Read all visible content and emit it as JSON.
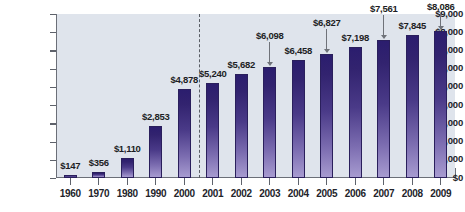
{
  "chart_data": {
    "type": "bar",
    "title": "",
    "subtitle": "",
    "xlabel": "",
    "ylabel": "",
    "ylim": [
      0,
      9000
    ],
    "ytick_step": 1000,
    "grid": false,
    "legend": null,
    "value_prefix": "$",
    "categories": [
      "1960",
      "1970",
      "1980",
      "1990",
      "2000",
      "2001",
      "2002",
      "2003",
      "2004",
      "2005",
      "2006",
      "2007",
      "2008",
      "2009"
    ],
    "values": [
      147,
      356,
      1110,
      2853,
      4878,
      5240,
      5682,
      6098,
      6458,
      6827,
      7198,
      7561,
      7845,
      8086
    ],
    "value_labels": [
      "$147",
      "$356",
      "$1,110",
      "$2,853",
      "$4,878",
      "$5,240",
      "$5,682",
      "$6,098",
      "$6,458",
      "$6,827",
      "$7,198",
      "$7,561",
      "$7,845",
      "$8,086"
    ],
    "ytick_labels": [
      "$9,000",
      "$8,000",
      "$7,000",
      "$6,000",
      "$5,000",
      "$4,000",
      "$3,000",
      "$2,000",
      "$1,000",
      "$0"
    ],
    "ytick_values": [
      9000,
      8000,
      7000,
      6000,
      5000,
      4000,
      3000,
      2000,
      1000,
      0
    ],
    "annotations": [
      {
        "label": "$6,098",
        "category": "2003",
        "style": "arrow-down"
      },
      {
        "label": "$6,827",
        "category": "2005",
        "style": "arrow-down"
      },
      {
        "label": "$7,561",
        "category": "2007",
        "style": "arrow-down"
      },
      {
        "label": "$8,086",
        "category": "2009",
        "style": "arrow-down"
      }
    ],
    "divider": {
      "between": [
        "2000",
        "2001"
      ],
      "style": "dashed"
    },
    "colors": {
      "bar_top": "#2b1d6e",
      "bar_bottom": "#a79bd0",
      "bar_border": "#2a1f5c",
      "plot_background": "#dfe4ec",
      "axis": "#6b6f78",
      "text": "#23242a",
      "leader": "#6f7279",
      "page_background": "#ffffff"
    }
  }
}
